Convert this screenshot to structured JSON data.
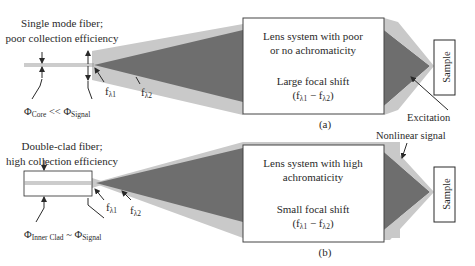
{
  "panel_a": {
    "caption": "(a)",
    "fiber_title_line1": "Single mode fiber;",
    "fiber_title_line2": "poor collection efficiency",
    "phi_left_symbol": "Φ",
    "phi_left_sub": "Core",
    "phi_relation": " << ",
    "phi_right_symbol": "Φ",
    "phi_right_sub": "Signal",
    "f1_base": "f",
    "f1_sub": "λ1",
    "f2_base": "f",
    "f2_sub": "λ2",
    "lens_line1": "Lens system with poor",
    "lens_line2": "or no achromaticity",
    "shift_line1": "Large focal shift",
    "shift_open": "(f",
    "shift_sub1": "λ1",
    "shift_mid": " − f",
    "shift_sub2": "λ2",
    "shift_close": ")",
    "sample": "Sample",
    "excitation": "Excitation"
  },
  "panel_b": {
    "caption": "(b)",
    "fiber_title_line1": "Double-clad fiber;",
    "fiber_title_line2": "high collection efficiency",
    "phi_left_symbol": "Φ",
    "phi_left_sub": "Inner Clad",
    "phi_relation": " ~ ",
    "phi_right_symbol": "Φ",
    "phi_right_sub": "Signal",
    "f1_base": "f",
    "f1_sub": "λ1",
    "f2_base": "f",
    "f2_sub": "λ2",
    "lens_line1": "Lens system with high",
    "lens_line2": "achromaticity",
    "shift_line1": "Small focal shift",
    "shift_open": "(f",
    "shift_sub1": "λ1",
    "shift_mid": " − f",
    "shift_sub2": "λ2",
    "shift_close": ")",
    "sample": "Sample",
    "nonlinear_signal": "Nonlinear signal"
  },
  "colors": {
    "dark_beam": "#6e6e6e",
    "light_beam": "#c9c9c9",
    "line": "#2a2a2a"
  }
}
